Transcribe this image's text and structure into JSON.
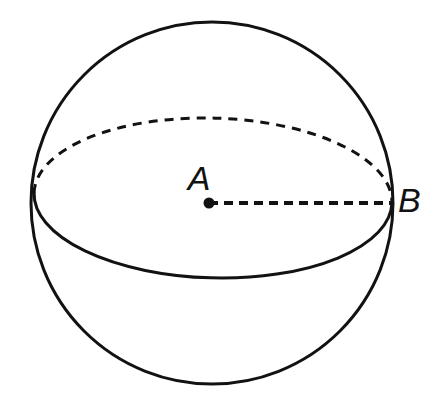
{
  "figure": {
    "type": "geometry-diagram",
    "background_color": "#ffffff",
    "stroke_color": "#121212",
    "width": 435,
    "height": 403
  },
  "labels": {
    "center_point": "A",
    "surface_point": "B"
  },
  "geometry": {
    "sphere_outline": {
      "name": "sphere-great-circle-outline",
      "center_x": 212,
      "center_y": 203,
      "radius": 181,
      "stroke_width": 3,
      "style": "solid"
    },
    "equator_ellipse": {
      "name": "equator-ellipse",
      "center_x": 213,
      "center_y": 198,
      "radius_x": 179,
      "radius_y": 80,
      "rotation_deg": 1.6,
      "stroke_width": 3,
      "front_half_style": "solid",
      "back_half_style": "dashed",
      "dash_pattern": "9 7"
    },
    "radius_segment": {
      "name": "radius-segment-a-to-b",
      "from_x": 209,
      "from_y": 203,
      "to_x": 392,
      "to_y": 203,
      "stroke_width": 4,
      "style": "dashed",
      "dash_pattern": "9 6"
    },
    "center_dot": {
      "name": "center-point-dot",
      "cx": 209,
      "cy": 203,
      "r": 5.5
    }
  },
  "label_positions": {
    "a": {
      "x": 199,
      "y": 190,
      "font_size": 34
    },
    "b": {
      "x": 398,
      "y": 212,
      "font_size": 34
    }
  }
}
